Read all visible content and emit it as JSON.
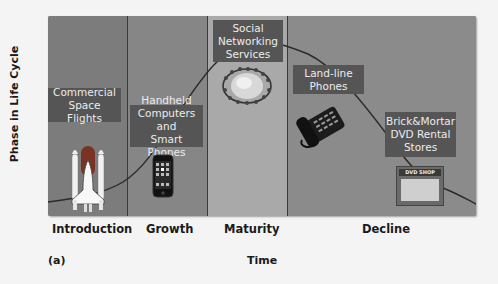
{
  "diagram": {
    "y_axis_label": "Phase in Life Cycle",
    "x_axis_label": "Time",
    "figure_label": "(a)",
    "colors": {
      "introduction": "#7c7c7c",
      "growth": "#868686",
      "maturity": "#a9a9a9",
      "decline": "#8b8b8b",
      "label_box": "#555555",
      "curve": "#2a2a2a"
    },
    "phases": [
      {
        "name": "Introduction"
      },
      {
        "name": "Growth"
      },
      {
        "name": "Maturity"
      },
      {
        "name": "Decline"
      }
    ],
    "examples": [
      {
        "label_lines": [
          "Commercial",
          "Space Flights"
        ],
        "phase": "Introduction",
        "icon": "space-shuttle-icon"
      },
      {
        "label_lines": [
          "Handheld",
          "Computers and",
          "Smart Phones"
        ],
        "phase": "Growth",
        "icon": "smartphone-icon"
      },
      {
        "label_lines": [
          "Social",
          "Networking",
          "Services"
        ],
        "phase": "Maturity",
        "icon": "globe-people-icon"
      },
      {
        "label_lines": [
          "Land-line",
          "Phones"
        ],
        "phase": "Decline",
        "icon": "desk-phone-icon"
      },
      {
        "label_lines": [
          "Brick&Mortar",
          "DVD Rental",
          "Stores"
        ],
        "phase": "Decline",
        "icon": "dvd-shop-icon"
      }
    ],
    "shop_sign": "DVD SHOP"
  }
}
